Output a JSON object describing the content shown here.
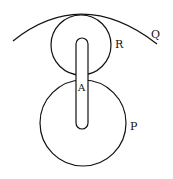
{
  "diagram": {
    "labels": {
      "Q": "Q",
      "R": "R",
      "A": "A",
      "P": "P"
    },
    "stroke_color": "#111111"
  }
}
